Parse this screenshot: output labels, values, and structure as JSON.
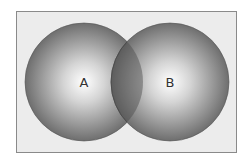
{
  "diagram": {
    "type": "venn",
    "frame": {
      "background": "#ececec",
      "border": "#8a8a8a"
    },
    "sets": [
      {
        "label": "A",
        "cx": 84,
        "cy": 82,
        "r": 59
      },
      {
        "label": "B",
        "cx": 170,
        "cy": 82,
        "r": 59
      }
    ],
    "colors": {
      "center": "#ffffff",
      "edge": "#6e6e6e",
      "overlap": "#5a5a5a"
    }
  }
}
